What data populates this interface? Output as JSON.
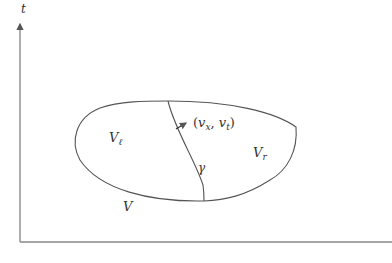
{
  "diagram": {
    "axes": {
      "vertical_label": "t"
    },
    "labels": {
      "region_left": {
        "main": "V",
        "sub": "ℓ"
      },
      "region_right": {
        "main": "V",
        "sub": "r"
      },
      "region_outer": "V",
      "curve": "γ",
      "normal_vector": {
        "open": "(",
        "a": "v",
        "a_sub": "x",
        "sep": ", ",
        "b": "v",
        "b_sub": "t",
        "close": ")"
      }
    },
    "colors": {
      "stroke": "#555555",
      "axis": "#777777",
      "text": "#333333"
    }
  }
}
